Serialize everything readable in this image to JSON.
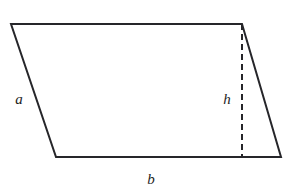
{
  "figure": {
    "shape_type": "parallelogram",
    "background_color": "#ffffff",
    "stroke_color": "#26262a",
    "stroke_width": 2,
    "dash_stroke_width": 2,
    "dash_pattern": "6 4",
    "canvas": {
      "width": 304,
      "height": 196
    },
    "vertices": {
      "top_left": {
        "x": 11,
        "y": 24
      },
      "top_right": {
        "x": 242,
        "y": 24
      },
      "bottom_right": {
        "x": 281,
        "y": 157
      },
      "bottom_left": {
        "x": 56,
        "y": 157
      }
    },
    "outline_path": "M 11 24 L 242 24 L 281 157 L 56 157 Z",
    "height_segment": {
      "name": "height-dashed-line",
      "x1": 242,
      "y1": 24,
      "x2": 242,
      "y2": 157
    },
    "labels": [
      {
        "id": "label-a",
        "text": "a",
        "x": 19,
        "y": 104,
        "describes": "left-slanted-side"
      },
      {
        "id": "label-h",
        "text": "h",
        "x": 227,
        "y": 104,
        "describes": "height-dashed-line"
      },
      {
        "id": "label-b",
        "text": "b",
        "x": 151,
        "y": 184,
        "describes": "bottom-base-side"
      }
    ]
  }
}
